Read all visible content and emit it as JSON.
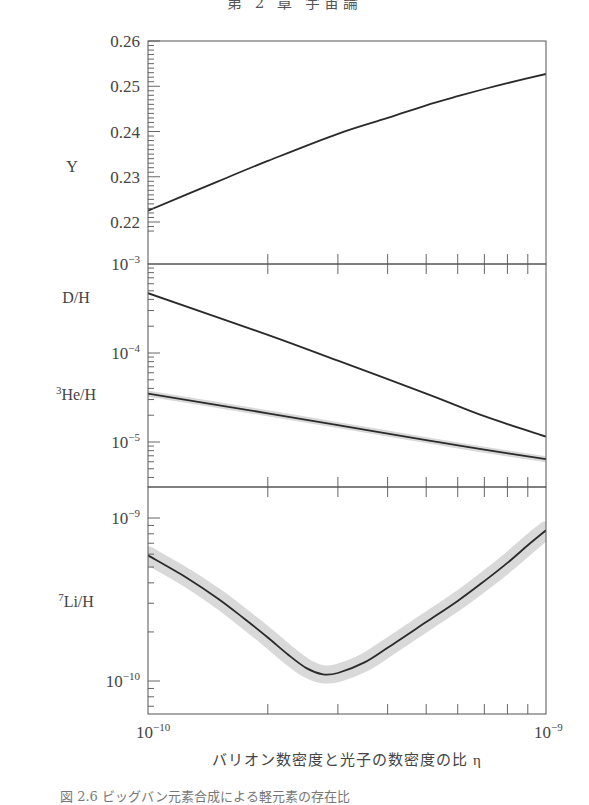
{
  "page": {
    "header_fragment": "第 2 章  宇宙論",
    "footer_fragment": "図 2.6  ビッグバン元素合成による軽元素の存在比"
  },
  "colors": {
    "axis": "#555555",
    "curve": "#2a2a2a",
    "band": "#d9d9d9",
    "text": "#444444"
  },
  "chart_data": [
    {
      "panel": "Y",
      "type": "line",
      "ylabel": "Y",
      "yscale": "linear",
      "ylim": [
        0.2195,
        0.26
      ],
      "yticks": [
        0.22,
        0.23,
        0.24,
        0.25,
        0.26
      ],
      "ytick_labels": [
        "0.22",
        "0.23",
        "0.24",
        "0.25",
        "0.26"
      ],
      "series": [
        {
          "name": "Y",
          "band": false,
          "x": [
            1e-10,
            1.5e-10,
            2e-10,
            3e-10,
            4e-10,
            5e-10,
            6e-10,
            7e-10,
            8e-10,
            1e-09
          ],
          "y": [
            0.2225,
            0.229,
            0.2335,
            0.2395,
            0.243,
            0.2458,
            0.2478,
            0.2494,
            0.2507,
            0.2527
          ]
        }
      ]
    },
    {
      "panel": "D/H and 3He/H",
      "type": "line",
      "yscale": "log",
      "ylim": [
        4.6e-06,
        0.001
      ],
      "yticks": [
        0.001,
        0.0001,
        1e-05
      ],
      "ytick_labels": [
        "10^-3",
        "10^-4",
        "10^-5"
      ],
      "labels": [
        {
          "text": "D/H",
          "sup": ""
        },
        {
          "text": "He/H",
          "sup": "3"
        }
      ],
      "series": [
        {
          "name": "D/H",
          "band": false,
          "x": [
            1e-10,
            2e-10,
            3e-10,
            5e-10,
            7e-10,
            1e-09
          ],
          "y": [
            0.00047,
            0.00016,
            8.2e-05,
            3.5e-05,
            1.95e-05,
            1.15e-05
          ]
        },
        {
          "name": "3He/H",
          "band": true,
          "x": [
            1e-10,
            2e-10,
            3e-10,
            5e-10,
            7e-10,
            1e-09
          ],
          "y": [
            3.5e-05,
            2.1e-05,
            1.55e-05,
            1.05e-05,
            8.2e-06,
            6.4e-06
          ]
        }
      ]
    },
    {
      "panel": "7Li/H",
      "type": "line",
      "yscale": "log",
      "ylim": [
        6.2e-11,
        1.55e-09
      ],
      "yticks": [
        1e-09,
        1e-10
      ],
      "ytick_labels": [
        "10^-9",
        "10^-10"
      ],
      "labels": [
        {
          "text": "Li/H",
          "sup": "7"
        }
      ],
      "series": [
        {
          "name": "7Li/H",
          "band": true,
          "x": [
            1e-10,
            1.25e-10,
            1.5e-10,
            1.75e-10,
            2e-10,
            2.25e-10,
            2.5e-10,
            2.75e-10,
            3e-10,
            3.5e-10,
            4e-10,
            5e-10,
            6e-10,
            7e-10,
            8e-10,
            9e-10,
            1e-09
          ],
          "y": [
            5.9e-10,
            4.3e-10,
            3.2e-10,
            2.4e-10,
            1.85e-10,
            1.45e-10,
            1.2e-10,
            1.1e-10,
            1.12e-10,
            1.3e-10,
            1.6e-10,
            2.3e-10,
            3.1e-10,
            4.1e-10,
            5.3e-10,
            6.8e-10,
            8.4e-10
          ]
        }
      ]
    }
  ],
  "x_axis": {
    "scale": "log",
    "xlim": [
      1e-10,
      1e-09
    ],
    "tick_labels": [
      {
        "base": "10",
        "exp": "−10"
      },
      {
        "base": "10",
        "exp": "−9"
      }
    ],
    "xlabel": "バリオン数密度と光子の数密度の比 η"
  }
}
